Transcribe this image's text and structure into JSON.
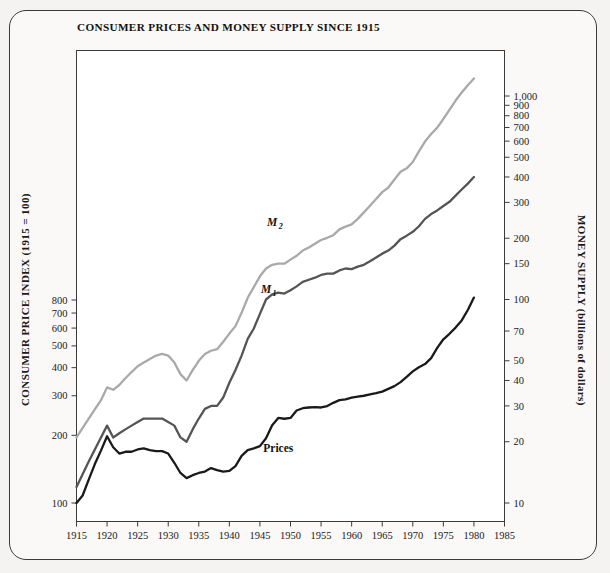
{
  "figure": {
    "title": "CONSUMER PRICES AND MONEY SUPPLY SINCE 1915",
    "background_color": "#faf9f7",
    "border_color": "#3b3b3b"
  },
  "chart_data": {
    "type": "line",
    "title": "CONSUMER PRICES AND MONEY SUPPLY SINCE 1915",
    "xlabel": "",
    "ylabel": "CONSUMER PRICE INDEX (1915 = 100)",
    "y2label": "MONEY SUPPLY (billions of dollars)",
    "grid": false,
    "legend": "inline-annotations",
    "x_scale": "linear",
    "y_scale": "log",
    "y2_scale": "log",
    "xlim": [
      1915,
      1985
    ],
    "ylim": [
      100,
      1000
    ],
    "y2lim": [
      10,
      2000
    ],
    "xticks": [
      1915,
      1920,
      1925,
      1930,
      1935,
      1940,
      1945,
      1950,
      1955,
      1960,
      1965,
      1970,
      1975,
      1980,
      1985
    ],
    "xticklabels": [
      "1915",
      "1920",
      "1925",
      "1930",
      "1935",
      "1940",
      "1945",
      "1950",
      "1955",
      "1960",
      "1965",
      "1970",
      "1975",
      "1980",
      "1985"
    ],
    "yticks": [
      100,
      200,
      300,
      400,
      500,
      600,
      700,
      800
    ],
    "yticklabels": [
      "100",
      "200",
      "300",
      "400",
      "500",
      "600",
      "700",
      "800"
    ],
    "y2ticks": [
      10,
      20,
      30,
      40,
      50,
      70,
      100,
      150,
      200,
      300,
      400,
      500,
      600,
      700,
      800,
      900,
      1000
    ],
    "y2ticklabels": [
      "10",
      "20",
      "30",
      "40",
      "50",
      "70",
      "100",
      "150",
      "200",
      "300",
      "400",
      "500",
      "600",
      "700",
      "800",
      "900",
      "1,000"
    ],
    "series": [
      {
        "name": "M2",
        "label": "M",
        "label_sub": "2",
        "color": "#a9a9a9",
        "axis": "right",
        "label_x": 1947,
        "label_y": 230,
        "x": [
          1915,
          1917,
          1919,
          1920,
          1921,
          1922,
          1923,
          1924,
          1925,
          1926,
          1927,
          1928,
          1929,
          1930,
          1931,
          1932,
          1933,
          1934,
          1935,
          1936,
          1937,
          1938,
          1939,
          1940,
          1941,
          1942,
          1943,
          1944,
          1945,
          1946,
          1947,
          1948,
          1949,
          1950,
          1951,
          1952,
          1953,
          1954,
          1955,
          1956,
          1957,
          1958,
          1959,
          1960,
          1961,
          1962,
          1963,
          1964,
          1965,
          1966,
          1967,
          1968,
          1969,
          1970,
          1971,
          1972,
          1973,
          1974,
          1975,
          1976,
          1977,
          1978,
          1979,
          1980
        ],
        "y": [
          21,
          26,
          32,
          37,
          36,
          38,
          41,
          44,
          47,
          49,
          51,
          53,
          54,
          53,
          49,
          43,
          40,
          45,
          50,
          54,
          56,
          57,
          62,
          68,
          74,
          86,
          102,
          115,
          130,
          142,
          148,
          150,
          150,
          157,
          164,
          174,
          180,
          188,
          196,
          201,
          207,
          221,
          228,
          234,
          249,
          268,
          289,
          312,
          337,
          355,
          389,
          424,
          441,
          474,
          534,
          597,
          650,
          699,
          771,
          855,
          950,
          1040,
          1130,
          1220
        ]
      },
      {
        "name": "M1",
        "label": "M",
        "label_sub": "1",
        "color": "#555555",
        "axis": "right",
        "label_x": 1946,
        "label_y": 108,
        "x": [
          1915,
          1917,
          1919,
          1920,
          1921,
          1922,
          1923,
          1924,
          1925,
          1926,
          1927,
          1928,
          1929,
          1930,
          1931,
          1932,
          1933,
          1934,
          1935,
          1936,
          1937,
          1938,
          1939,
          1940,
          1941,
          1942,
          1943,
          1944,
          1945,
          1946,
          1947,
          1948,
          1949,
          1950,
          1951,
          1952,
          1953,
          1954,
          1955,
          1956,
          1957,
          1958,
          1959,
          1960,
          1961,
          1962,
          1963,
          1964,
          1965,
          1966,
          1967,
          1968,
          1969,
          1970,
          1971,
          1972,
          1973,
          1974,
          1975,
          1976,
          1977,
          1978,
          1979,
          1980
        ],
        "y": [
          12,
          16,
          21,
          24,
          21,
          22,
          23,
          24,
          25,
          26,
          26,
          26,
          26,
          25,
          24,
          21,
          20,
          23,
          26,
          29,
          30,
          30,
          33,
          39,
          45,
          53,
          64,
          72,
          85,
          100,
          106,
          108,
          107,
          111,
          116,
          122,
          125,
          128,
          132,
          134,
          134,
          139,
          142,
          141,
          145,
          148,
          154,
          161,
          168,
          174,
          184,
          198,
          206,
          215,
          229,
          249,
          263,
          274,
          288,
          302,
          324,
          347,
          371,
          400
        ]
      },
      {
        "name": "Prices",
        "label": "Prices",
        "color": "#1a1a1a",
        "axis": "left",
        "label_x": 1948,
        "label_y": 168,
        "x": [
          1915,
          1916,
          1917,
          1918,
          1919,
          1920,
          1921,
          1922,
          1923,
          1924,
          1925,
          1926,
          1927,
          1928,
          1929,
          1930,
          1931,
          1932,
          1933,
          1934,
          1935,
          1936,
          1937,
          1938,
          1939,
          1940,
          1941,
          1942,
          1943,
          1944,
          1945,
          1946,
          1947,
          1948,
          1949,
          1950,
          1951,
          1952,
          1953,
          1954,
          1955,
          1956,
          1957,
          1958,
          1959,
          1960,
          1961,
          1962,
          1963,
          1964,
          1965,
          1966,
          1967,
          1968,
          1969,
          1970,
          1971,
          1972,
          1973,
          1974,
          1975,
          1976,
          1977,
          1978,
          1979,
          1980
        ],
        "y": [
          100,
          108,
          127,
          149,
          171,
          198,
          177,
          166,
          169,
          169,
          173,
          175,
          172,
          170,
          170,
          166,
          151,
          136,
          129,
          133,
          136,
          138,
          143,
          140,
          138,
          139,
          146,
          162,
          172,
          175,
          179,
          194,
          222,
          239,
          237,
          239,
          258,
          264,
          266,
          267,
          266,
          270,
          279,
          287,
          289,
          294,
          297,
          300,
          304,
          308,
          313,
          322,
          331,
          345,
          364,
          385,
          402,
          415,
          441,
          490,
          535,
          566,
          603,
          649,
          722,
          820
        ]
      }
    ]
  },
  "labels": {
    "left_axis": "CONSUMER PRICE INDEX (1915 = 100)",
    "right_axis": "MONEY SUPPLY (billions of dollars)"
  }
}
